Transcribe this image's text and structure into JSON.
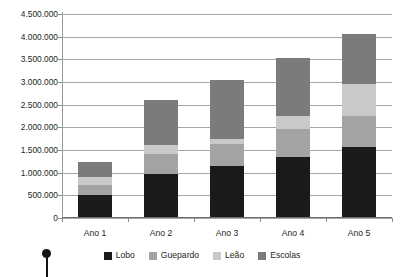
{
  "chart_data": {
    "type": "bar",
    "subtype": "stacked-column",
    "title": "",
    "xlabel": "",
    "ylabel": "",
    "categories": [
      "Ano 1",
      "Ano 2",
      "Ano 3",
      "Ano 4",
      "Ano 5"
    ],
    "series": [
      {
        "name": "Lobo",
        "color": "#1a1a1a",
        "values": [
          500000,
          980000,
          1150000,
          1340000,
          1560000
        ]
      },
      {
        "name": "Guepardo",
        "color": "#a3a3a3",
        "values": [
          230000,
          440000,
          480000,
          620000,
          700000
        ]
      },
      {
        "name": "Leão",
        "color": "#c9c9c9",
        "values": [
          180000,
          180000,
          120000,
          290000,
          700000
        ]
      },
      {
        "name": "Escolas",
        "color": "#7b7b7b",
        "values": [
          320000,
          1000000,
          1300000,
          1280000,
          1090000
        ]
      }
    ],
    "totals": [
      1230000,
      2600000,
      3050000,
      3530000,
      4050000
    ],
    "ylim": [
      0,
      4500000
    ],
    "ytick_labels": [
      "4.500.000",
      "4.000.000",
      "3.500.000",
      "3.000.000",
      "2.500.000",
      "2.000.000",
      "1.500.000",
      "1.000.000",
      "500.000",
      "0"
    ],
    "ytick_values": [
      4500000,
      4000000,
      3500000,
      3000000,
      2500000,
      2000000,
      1500000,
      1000000,
      500000,
      0
    ],
    "ytick_step": 500000,
    "grid": true,
    "legend_position": "bottom",
    "legend": [
      "Lobo",
      "Guepardo",
      "Leão",
      "Escolas"
    ]
  },
  "axis": {
    "grid_color": "#a6a6aa",
    "axis_color": "#6d6d70",
    "tick_color": "#8a8a8e"
  },
  "cropped_title": "",
  "marker": {
    "name": "pin-marker",
    "color": "#131313"
  }
}
